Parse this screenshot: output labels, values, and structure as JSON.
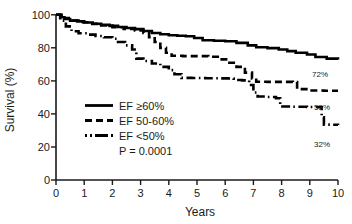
{
  "chart_data": {
    "type": "line",
    "title": "",
    "xlabel": "Years",
    "ylabel": "Survival (%)",
    "xlim": [
      0,
      10
    ],
    "ylim": [
      0,
      100
    ],
    "xticks": [
      "0",
      "1",
      "2",
      "3",
      "4",
      "5",
      "6",
      "7",
      "8",
      "9",
      "10"
    ],
    "yticks": [
      "0",
      "20",
      "40",
      "60",
      "80",
      "100"
    ],
    "grid": false,
    "legend_position": "center-left",
    "annotation": "P = 0.0001",
    "series": [
      {
        "name": "EF ≥ 60%",
        "style": "solid",
        "endpoint_label": "72%",
        "points": [
          [
            0.0,
            100
          ],
          [
            0.15,
            98.5
          ],
          [
            0.3,
            97.5
          ],
          [
            0.5,
            96.5
          ],
          [
            0.75,
            96.0
          ],
          [
            1.0,
            95.3
          ],
          [
            1.3,
            94.6
          ],
          [
            1.6,
            94.0
          ],
          [
            1.9,
            93.3
          ],
          [
            2.2,
            92.6
          ],
          [
            2.5,
            92.0
          ],
          [
            2.8,
            91.3
          ],
          [
            3.1,
            90.2
          ],
          [
            3.4,
            89.0
          ],
          [
            3.7,
            88.2
          ],
          [
            4.0,
            87.6
          ],
          [
            4.3,
            87.3
          ],
          [
            4.6,
            87.0
          ],
          [
            4.9,
            86.0
          ],
          [
            5.2,
            84.6
          ],
          [
            5.6,
            84.3
          ],
          [
            6.0,
            84.0
          ],
          [
            6.4,
            83.0
          ],
          [
            6.8,
            81.5
          ],
          [
            7.1,
            80.4
          ],
          [
            7.5,
            79.8
          ],
          [
            7.9,
            79.0
          ],
          [
            8.2,
            78.0
          ],
          [
            8.5,
            77.0
          ],
          [
            8.9,
            76.0
          ],
          [
            9.2,
            74.5
          ],
          [
            9.6,
            73.5
          ],
          [
            10.0,
            73.0
          ]
        ]
      },
      {
        "name": "EF 50-60%",
        "style": "dashed",
        "endpoint_label": "53%",
        "points": [
          [
            0.0,
            100
          ],
          [
            0.2,
            98.0
          ],
          [
            0.45,
            96.5
          ],
          [
            0.8,
            95.5
          ],
          [
            1.2,
            94.5
          ],
          [
            1.6,
            93.5
          ],
          [
            2.0,
            92.5
          ],
          [
            2.4,
            91.5
          ],
          [
            2.8,
            90.5
          ],
          [
            3.1,
            89.0
          ],
          [
            3.3,
            86.5
          ],
          [
            3.5,
            83.5
          ],
          [
            3.7,
            80.0
          ],
          [
            3.9,
            77.0
          ],
          [
            4.1,
            75.2
          ],
          [
            4.5,
            75.0
          ],
          [
            5.0,
            75.0
          ],
          [
            5.4,
            74.6
          ],
          [
            5.8,
            73.0
          ],
          [
            6.1,
            71.0
          ],
          [
            6.4,
            68.5
          ],
          [
            6.7,
            65.0
          ],
          [
            6.95,
            61.5
          ],
          [
            7.1,
            59.5
          ],
          [
            7.5,
            59.4
          ],
          [
            8.0,
            59.4
          ],
          [
            8.4,
            59.3
          ],
          [
            8.55,
            55.0
          ],
          [
            9.0,
            54.2
          ],
          [
            9.5,
            54.0
          ],
          [
            10.0,
            54.0
          ]
        ]
      },
      {
        "name": "EF < 50%",
        "style": "dashdot",
        "endpoint_label": "32%",
        "points": [
          [
            0.0,
            100
          ],
          [
            0.15,
            96.5
          ],
          [
            0.35,
            93.0
          ],
          [
            0.55,
            90.0
          ],
          [
            0.8,
            88.8
          ],
          [
            1.1,
            88.0
          ],
          [
            1.4,
            87.2
          ],
          [
            1.7,
            86.4
          ],
          [
            2.0,
            85.5
          ],
          [
            2.2,
            83.5
          ],
          [
            2.45,
            81.5
          ],
          [
            2.7,
            79.0
          ],
          [
            2.85,
            73.5
          ],
          [
            3.1,
            72.0
          ],
          [
            3.4,
            70.5
          ],
          [
            3.7,
            68.5
          ],
          [
            4.0,
            66.5
          ],
          [
            4.2,
            64.0
          ],
          [
            4.45,
            61.8
          ],
          [
            4.8,
            61.7
          ],
          [
            5.3,
            61.6
          ],
          [
            5.8,
            61.5
          ],
          [
            6.1,
            61.4
          ],
          [
            6.3,
            60.5
          ],
          [
            6.6,
            60.3
          ],
          [
            6.85,
            57.5
          ],
          [
            7.0,
            53.0
          ],
          [
            7.15,
            50.5
          ],
          [
            7.5,
            50.2
          ],
          [
            7.8,
            49.5
          ],
          [
            7.95,
            44.5
          ],
          [
            8.4,
            44.3
          ],
          [
            8.9,
            44.2
          ],
          [
            9.3,
            44.0
          ],
          [
            9.42,
            38.0
          ],
          [
            9.5,
            33.5
          ],
          [
            9.8,
            33.4
          ],
          [
            10.0,
            33.3
          ]
        ]
      }
    ]
  },
  "legend": {
    "items": [
      {
        "label": "EF ≥60%",
        "style": "solid"
      },
      {
        "label": "EF 50-60%",
        "style": "dashed"
      },
      {
        "label": "EF <50%",
        "style": "dashdot"
      }
    ],
    "pvalue": "P = 0.0001"
  },
  "axes": {
    "x_title": "Years",
    "y_title": "Survival (%)",
    "x_ticks": [
      "0",
      "1",
      "2",
      "3",
      "4",
      "5",
      "6",
      "7",
      "8",
      "9",
      "10"
    ],
    "y_ticks": [
      "100",
      "80",
      "60",
      "40",
      "20",
      "0"
    ]
  },
  "endpoint_labels": {
    "solid": "72%",
    "dashed": "53%",
    "dashdot": "32%"
  },
  "colors": {
    "ink": "#1a1a1a",
    "curve": "#000000",
    "background": "#ffffff"
  }
}
